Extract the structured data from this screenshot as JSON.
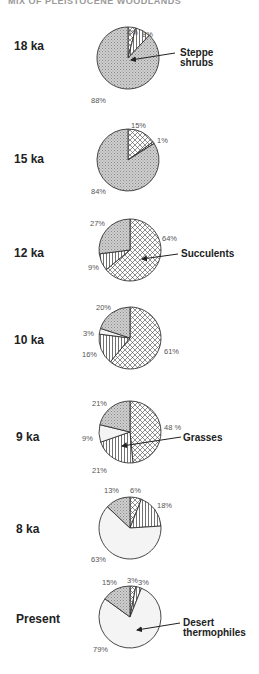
{
  "header": {
    "title_partial": "MIX OF PLEISTOCENE WOODLANDS"
  },
  "colors": {
    "steppe": "#c8c8c8",
    "desert": "#f4f4f4",
    "line": "#333333"
  },
  "chart_data": {
    "type": "pie",
    "legend_callouts": [
      "Steppe shrubs",
      "Succulents",
      "Grasses",
      "Desert thermophiles"
    ],
    "categories": [
      "Succulents",
      "Grasses",
      "Desert thermophiles",
      "Steppe shrubs"
    ],
    "pies": [
      {
        "label": "18 ka",
        "values": {
          "Succulents": 4,
          "Grasses": 8,
          "Desert thermophiles": 0,
          "Steppe shrubs": 88
        },
        "callout": "Steppe shrubs"
      },
      {
        "label": "15 ka",
        "values": {
          "Succulents": 15,
          "Grasses": 1,
          "Desert thermophiles": 0,
          "Steppe shrubs": 84
        }
      },
      {
        "label": "12 ka",
        "values": {
          "Succulents": 64,
          "Grasses": 9,
          "Desert thermophiles": 0,
          "Steppe shrubs": 27
        },
        "callout": "Succulents"
      },
      {
        "label": "10 ka",
        "values": {
          "Succulents": 61,
          "Grasses": 16,
          "Desert thermophiles": 3,
          "Steppe shrubs": 20
        }
      },
      {
        "label": "9 ka",
        "values": {
          "Succulents": 48,
          "Grasses": 21,
          "Desert thermophiles": 9,
          "Steppe shrubs": 21
        },
        "callout": "Grasses"
      },
      {
        "label": "8 ka",
        "values": {
          "Succulents": 6,
          "Grasses": 18,
          "Desert thermophiles": 63,
          "Steppe shrubs": 13
        }
      },
      {
        "label": "Present",
        "values": {
          "Succulents": 3,
          "Grasses": 3,
          "Desert thermophiles": 79,
          "Steppe shrubs": 15
        },
        "callout": "Desert thermophiles"
      }
    ]
  },
  "labels": {
    "ka18": "18 ka",
    "ka15": "15 ka",
    "ka12": "12 ka",
    "ka10": "10 ka",
    "ka9": "9 ka",
    "ka8": "8 ka",
    "present": "Present",
    "p18": [
      "4%",
      "8%",
      "88%"
    ],
    "p15": [
      "15%",
      "1%",
      "84%"
    ],
    "p12": [
      "64%",
      "9%",
      "27%"
    ],
    "p10": [
      "61%",
      "16%",
      "3%",
      "20%"
    ],
    "p9": [
      "48 %",
      "21%",
      "9%",
      "21%"
    ],
    "p8": [
      "6%",
      "18%",
      "63%",
      "13%"
    ],
    "pp": [
      "3%",
      "3%",
      "79%",
      "15%"
    ],
    "callout_steppe_1": "Steppe",
    "callout_steppe_2": "shrubs",
    "callout_succulents": "Succulents",
    "callout_grasses": "Grasses",
    "callout_desert_1": "Desert",
    "callout_desert_2": "thermophiles"
  }
}
